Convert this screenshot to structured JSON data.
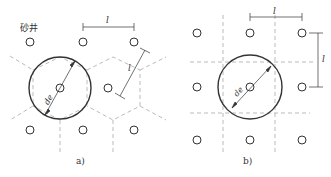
{
  "figure_a": {
    "caption": "a)",
    "sand_well_label": "砂井",
    "spacing_label": "l",
    "diameter_label": "de",
    "layout": "triangular (hexagonal influence zones)"
  },
  "figure_b": {
    "caption": "b)",
    "spacing_label": "l",
    "diameter_label": "de",
    "layout": "square (square influence zones)"
  },
  "colors": {
    "stroke": "#333333",
    "dashed": "#aaaaaa",
    "background": "#ffffff"
  }
}
